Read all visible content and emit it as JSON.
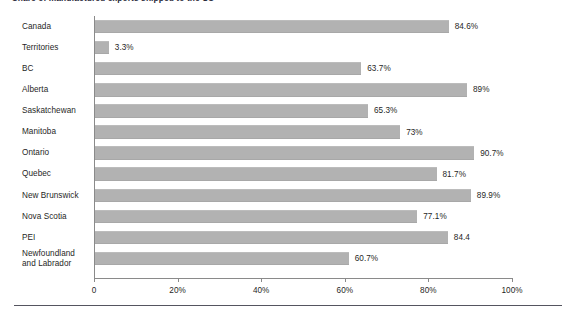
{
  "title": "Share of manufactured exports shipped to the US",
  "chart_data": {
    "type": "bar",
    "orientation": "horizontal",
    "title": "Share of manufactured exports shipped to the US",
    "xlabel": "",
    "ylabel": "",
    "xlim": [
      0,
      100
    ],
    "grid": false,
    "legend": "none",
    "bar_color": "#b2b2b2",
    "axis_color": "#8a8a8a",
    "categories": [
      "Canada",
      "Territories",
      "BC",
      "Alberta",
      "Saskatchewan",
      "Manitoba",
      "Ontario",
      "Quebec",
      "New Brunswick",
      "Nova Scotia",
      "PEI",
      "Newfoundland and Labrador"
    ],
    "values": [
      84.6,
      3.3,
      63.7,
      89,
      65.3,
      73,
      90.7,
      81.7,
      89.9,
      77.1,
      84.4,
      60.7
    ],
    "data_labels": [
      "84.6%",
      "3.3%",
      "63.7%",
      "89%",
      "65.3%",
      "73%",
      "90.7%",
      "81.7%",
      "89.9%",
      "77.1%",
      "84.4",
      "60.7%"
    ],
    "xticks": [
      0,
      20,
      40,
      60,
      80,
      100
    ],
    "xticklabels": [
      "0",
      "20%",
      "40%",
      "60%",
      "80%",
      "100%"
    ]
  },
  "rows": [
    {
      "label": "Canada",
      "value": 84.6,
      "display": "84.6%"
    },
    {
      "label": "Territories",
      "value": 3.3,
      "display": "3.3%"
    },
    {
      "label": "BC",
      "value": 63.7,
      "display": "63.7%"
    },
    {
      "label": "Alberta",
      "value": 89,
      "display": "89%"
    },
    {
      "label": "Saskatchewan",
      "value": 65.3,
      "display": "65.3%"
    },
    {
      "label": "Manitoba",
      "value": 73,
      "display": "73%"
    },
    {
      "label": "Ontario",
      "value": 90.7,
      "display": "90.7%"
    },
    {
      "label": "Quebec",
      "value": 81.7,
      "display": "81.7%"
    },
    {
      "label": "New Brunswick",
      "value": 89.9,
      "display": "89.9%"
    },
    {
      "label": "Nova Scotia",
      "value": 77.1,
      "display": "77.1%"
    },
    {
      "label": "PEI",
      "value": 84.4,
      "display": "84.4"
    },
    {
      "label": "Newfoundland and Labrador",
      "value": 60.7,
      "display": "60.7%"
    }
  ],
  "xticklabels": [
    "0",
    "20%",
    "40%",
    "60%",
    "80%",
    "100%"
  ]
}
